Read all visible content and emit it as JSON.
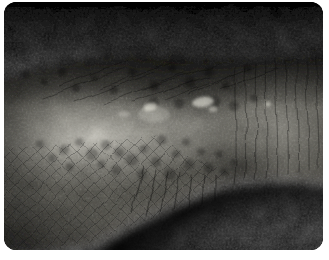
{
  "figure": {
    "kind": "medical-photograph",
    "alt": "Clinical close-up photograph of a limb lying horizontally against a black background; the skin shows a mottled, pitted texture with scattered darker depressions, a few small pale lesions near the center, fine criss-cross crease lines over the lower half, vertical flexural creases on the right, and a bright light highlight over the center-left of the limb. The photograph has rounded corners on a white backing."
  },
  "palette": {
    "page_background": "#ffffff",
    "photo_background": "#030303",
    "skin_base": "#565550",
    "skin_mid": "#6b6a65",
    "skin_highlight": "#b3b1a8",
    "lesion_highlight": "#fffdf2",
    "crease_shadow": "#0d0d0c"
  }
}
